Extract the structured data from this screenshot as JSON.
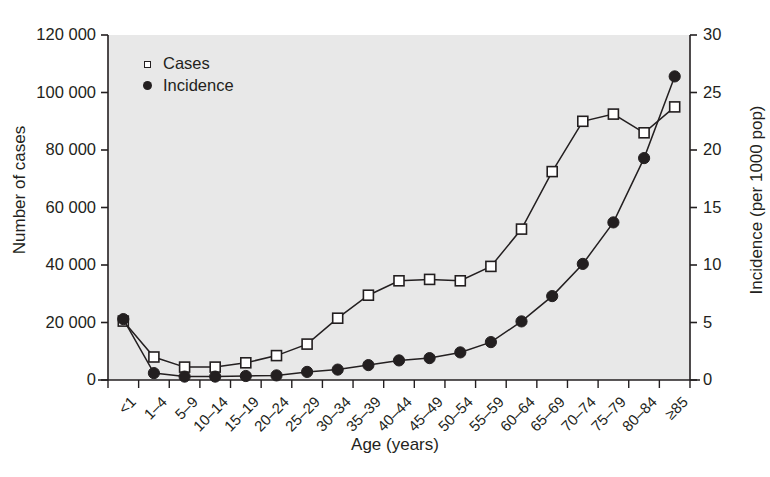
{
  "chart_data": {
    "type": "line",
    "title": "",
    "xlabel": "Age (years)",
    "ylabel": "Number of cases",
    "ylabel_right": "Incidence (per 1000 pop)",
    "grid": false,
    "legend_position": "top-left",
    "categories": [
      "<1",
      "1–4",
      "5–9",
      "10–14",
      "15–19",
      "20–24",
      "25–29",
      "30–34",
      "35–39",
      "40–44",
      "45–49",
      "50–54",
      "55–59",
      "60–64",
      "65–69",
      "70–74",
      "75–79",
      "80–84",
      "≥85"
    ],
    "ylim": [
      0,
      120000
    ],
    "yticks": [
      0,
      20000,
      40000,
      60000,
      80000,
      100000,
      120000
    ],
    "ytick_labels": [
      "0",
      "20 000",
      "40 000",
      "60 000",
      "80 000",
      "100 000",
      "120 000"
    ],
    "ylim_right": [
      0,
      30
    ],
    "yticks_right": [
      0,
      5,
      10,
      15,
      20,
      25,
      30
    ],
    "ytick_labels_right": [
      "0",
      "5",
      "10",
      "15",
      "20",
      "25",
      "30"
    ],
    "series": [
      {
        "name": "Cases",
        "axis": "left",
        "marker": "open-square",
        "color": "#231f20",
        "values": [
          20500,
          8000,
          4500,
          4500,
          6000,
          8500,
          12500,
          21500,
          29500,
          34500,
          35000,
          34500,
          39500,
          52500,
          72500,
          90000,
          92500,
          86000,
          95000
        ]
      },
      {
        "name": "Incidence",
        "axis": "right",
        "marker": "filled-circle",
        "color": "#231f20",
        "values": [
          5.3,
          0.6,
          0.3,
          0.3,
          0.35,
          0.4,
          0.7,
          0.9,
          1.3,
          1.7,
          1.9,
          2.4,
          3.3,
          5.1,
          7.3,
          10.1,
          13.7,
          19.3,
          26.4
        ]
      }
    ]
  },
  "legend": {
    "items": [
      {
        "label": "Cases",
        "marker": "open-square"
      },
      {
        "label": "Incidence",
        "marker": "filled-circle"
      }
    ]
  },
  "colors": {
    "plot_background": "#e8e8e8",
    "axis": "#231f20",
    "text": "#231f20",
    "page_background": "#ffffff"
  }
}
